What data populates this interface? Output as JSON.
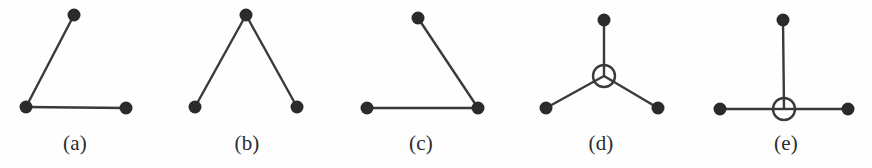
{
  "figure": {
    "caption_font_style": "serif",
    "background_color": "#fefefe",
    "stroke_color": "#3a3a3a",
    "filled_node_color": "#2b2b2b",
    "open_node_fill": "#fefefe",
    "node_radius": 6.5,
    "open_node_radius": 11,
    "edge_width": 2.4,
    "width": 872,
    "height": 168,
    "panels": [
      {
        "id": "panel-a",
        "label": "(a)",
        "label_x": 75,
        "label_y": 133,
        "description": "path of three filled nodes, bend at lower-left",
        "nodes": [
          {
            "id": "a-top",
            "type": "filled",
            "x": 74,
            "y": 15
          },
          {
            "id": "a-corner",
            "type": "filled",
            "x": 26,
            "y": 107
          },
          {
            "id": "a-right",
            "type": "filled",
            "x": 126,
            "y": 108
          }
        ],
        "edges": [
          {
            "from": "a-top",
            "to": "a-corner"
          },
          {
            "from": "a-corner",
            "to": "a-right"
          }
        ]
      },
      {
        "id": "panel-b",
        "label": "(b)",
        "label_x": 247,
        "label_y": 133,
        "description": "inverted V, apex filled node at top center",
        "nodes": [
          {
            "id": "b-top",
            "type": "filled",
            "x": 246,
            "y": 15
          },
          {
            "id": "b-left",
            "type": "filled",
            "x": 195,
            "y": 107
          },
          {
            "id": "b-right",
            "type": "filled",
            "x": 297,
            "y": 107
          }
        ],
        "edges": [
          {
            "from": "b-left",
            "to": "b-top"
          },
          {
            "from": "b-top",
            "to": "b-right"
          }
        ]
      },
      {
        "id": "panel-c",
        "label": "(c)",
        "label_x": 421,
        "label_y": 133,
        "description": "path of three filled nodes, bend at lower-right",
        "nodes": [
          {
            "id": "c-top",
            "type": "filled",
            "x": 418,
            "y": 18
          },
          {
            "id": "c-left",
            "type": "filled",
            "x": 367,
            "y": 108
          },
          {
            "id": "c-corner",
            "type": "filled",
            "x": 478,
            "y": 108
          }
        ],
        "edges": [
          {
            "from": "c-top",
            "to": "c-corner"
          },
          {
            "from": "c-left",
            "to": "c-corner"
          }
        ]
      },
      {
        "id": "panel-d",
        "label": "(d)",
        "label_x": 601,
        "label_y": 133,
        "description": "three-pronged star with open circle hub, prongs up, lower-left, lower-right",
        "nodes": [
          {
            "id": "d-hub",
            "type": "open",
            "x": 604,
            "y": 76
          },
          {
            "id": "d-top",
            "type": "filled",
            "x": 604,
            "y": 20
          },
          {
            "id": "d-left",
            "type": "filled",
            "x": 546,
            "y": 108
          },
          {
            "id": "d-right",
            "type": "filled",
            "x": 658,
            "y": 108
          }
        ],
        "edges": [
          {
            "from": "d-hub",
            "to": "d-top"
          },
          {
            "from": "d-hub",
            "to": "d-left"
          },
          {
            "from": "d-hub",
            "to": "d-right"
          }
        ]
      },
      {
        "id": "panel-e",
        "label": "(e)",
        "label_x": 786,
        "label_y": 133,
        "description": "T-shaped star with open circle hub, prongs up, left, right",
        "nodes": [
          {
            "id": "e-hub",
            "type": "open",
            "x": 784,
            "y": 109
          },
          {
            "id": "e-top",
            "type": "filled",
            "x": 783,
            "y": 20
          },
          {
            "id": "e-left",
            "type": "filled",
            "x": 720,
            "y": 109
          },
          {
            "id": "e-right",
            "type": "filled",
            "x": 848,
            "y": 109
          }
        ],
        "edges": [
          {
            "from": "e-hub",
            "to": "e-top"
          },
          {
            "from": "e-hub",
            "to": "e-left"
          },
          {
            "from": "e-hub",
            "to": "e-right"
          }
        ]
      }
    ]
  }
}
